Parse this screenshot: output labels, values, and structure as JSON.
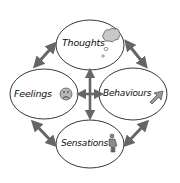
{
  "diagram": {
    "type": "cycle",
    "colors": {
      "background": "#ffffff",
      "ellipse_stroke": "#222222",
      "arrow": "#666666",
      "icon_fill": "#9a9a9a",
      "text": "#111111"
    },
    "nodes": [
      {
        "id": "thoughts",
        "label": "Thoughts",
        "icon": "thought-cloud-icon",
        "position": "top"
      },
      {
        "id": "feelings",
        "label": "Feelings",
        "icon": "sad-face-icon",
        "position": "left"
      },
      {
        "id": "behaviours",
        "label": "Behaviours",
        "icon": "arrow-up-right-icon",
        "position": "right"
      },
      {
        "id": "sensations",
        "label": "Sensations",
        "icon": "body-figure-icon",
        "position": "bottom"
      }
    ],
    "edges": [
      {
        "from": "thoughts",
        "to": "feelings",
        "direction": "both"
      },
      {
        "from": "thoughts",
        "to": "behaviours",
        "direction": "both"
      },
      {
        "from": "feelings",
        "to": "sensations",
        "direction": "both"
      },
      {
        "from": "behaviours",
        "to": "sensations",
        "direction": "both"
      },
      {
        "from": "thoughts",
        "to": "sensations",
        "direction": "both"
      },
      {
        "from": "feelings",
        "to": "behaviours",
        "direction": "both"
      }
    ]
  }
}
